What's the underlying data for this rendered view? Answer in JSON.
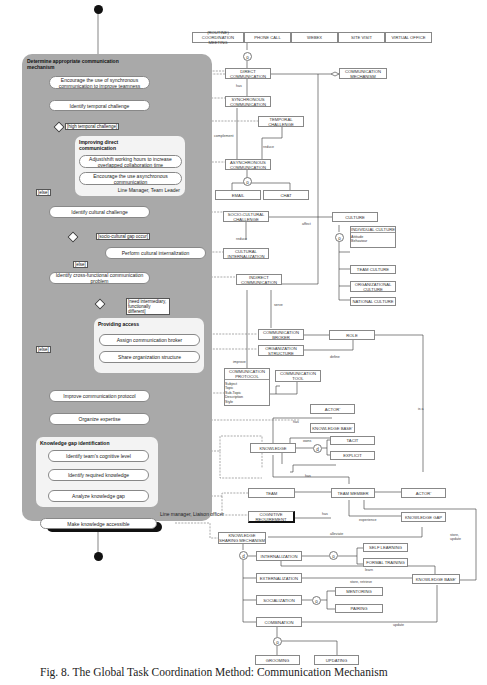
{
  "activity": {
    "panel_title": "Determine appropriate communication mechanism",
    "panel_role": "Line manager, Liaison officer",
    "actions": [
      "Encourage the use of synchronous communication to improve teamness",
      "Identify temporal challenge",
      "Identify cultural challenge",
      "Perform cultural internalization",
      "Identify cross-functional communication problem",
      "Improve communication protocol",
      "Organize expertise",
      "Make knowledge accessible"
    ],
    "guards": {
      "temporal": "[high temporal challenge]",
      "cultural": "[socio-cultural gap occur]",
      "intermediary": "[need intermediary, functionally different]",
      "else": "[else]"
    },
    "groups": [
      {
        "title": "Improving direct communication",
        "actions": [
          "Adjust/shift working hours to increase overlapped collaboration time",
          "Encourage the use asynchronous communication"
        ],
        "role": "Line Manager, Team Leader"
      },
      {
        "title": "Providing access",
        "actions": [
          "Assign communication broker",
          "Share organization structure"
        ]
      },
      {
        "title": "Knowledge gap identification",
        "actions": [
          "Identify team's cognitive level",
          "Identify required knowledge",
          "Analyze knowledge gap"
        ]
      }
    ]
  },
  "classes": {
    "routine_meeting": "(ROUTINE) COORDINATION MEETING",
    "phone_call": "PHONE CALL",
    "webex": "WEBEX",
    "site_visit": "SITE VISIT",
    "virtual_office": "VIRTUAL OFFICE",
    "direct_communication": "DIRECT COMMUNICATION",
    "communication_mechanism": "COMMUNICATION MECHANISM",
    "synchronous_communication": "SYNCHRONOUS COMMUNICATION",
    "temporal_challenge": "TEMPORAL CHALLENGE",
    "asynchronous_communication": "ASYNCHRONOUS COMMUNICATION",
    "email": "EMAIL",
    "chat": "CHAT",
    "socio_cultural_challenge": "SOCIO-CULTURAL CHALLENGE",
    "culture": "CULTURE",
    "individual_culture": "INDIVIDUAL CULTURE",
    "individual_culture_attrs": "Attitude\nBehaviour",
    "team_culture": "TEAM CULTURE",
    "organizational_culture": "ORGANIZATIONAL CULTURE",
    "national_culture": "NATIONAL CULTURE",
    "cultural_internalization": "CULTURAL INTERNALIZATION",
    "indirect_communication": "INDIRECT COMMUNICATION",
    "communication_broker": "COMMUNICATION BROKER",
    "role": "ROLE",
    "organization_structure": "ORGANIZATION STRUCTURE",
    "communication_protocol": "COMMUNICATION PROTOCOL",
    "communication_protocol_attrs": "Subject\nTopic\nSub-Topic\nDescription\nStyle",
    "communication_tool": "COMMUNICATION TOOL",
    "actor_1": "ACTOR'",
    "knowledge_base_1": "KNOWLEDGE BASE'",
    "knowledge": "KNOWLEDGE",
    "tacit": "TACIT",
    "explicit": "EXPLICIT",
    "team": "TEAM",
    "team_member": "TEAM MEMBER",
    "actor_2": "ACTOR'",
    "cognitive_requirement": "COGNITIVE REQUIREMENT",
    "knowledge_gap": "KNOWLEDGE GAP",
    "knowledge_sharing_mechanism": "KNOWLEDGE SHARING MECHANISM",
    "internalization": "INTERNALIZATION",
    "self_learning": "SELF LEARNING",
    "formal_training": "FORMAL TRAINING",
    "externalization": "EXTERNALIZATION",
    "knowledge_base_2": "KNOWLEDGE BASE'",
    "socialization": "SOCIALIZATION",
    "mentoring": "MENTORING",
    "pairing": "PAIRING",
    "combination": "COMBINATION",
    "grooming": "GROOMING",
    "updating": "UPDATING"
  },
  "relations": {
    "has": "has",
    "complement": "complement",
    "reduce": "reduce",
    "affect": "affect",
    "reduce2": "reduce",
    "define": "define",
    "serve": "serve",
    "improve": "improve",
    "has_actor": "has",
    "owns": "owns",
    "is_a": "is a",
    "has_req": "has",
    "has_km": "has",
    "experience": "experience",
    "alleviate": "alleviate",
    "store_update": "store, update",
    "learn": "learn",
    "store_retrieve": "store, retrieve",
    "update": "update",
    "d": "d",
    "o": "o",
    "c": "c",
    "multiplicity_1": "1..1",
    "multiplicity_n": "1..*"
  },
  "caption": "Fig. 8. The Global Task Coordination Method: Communication Mechanism"
}
